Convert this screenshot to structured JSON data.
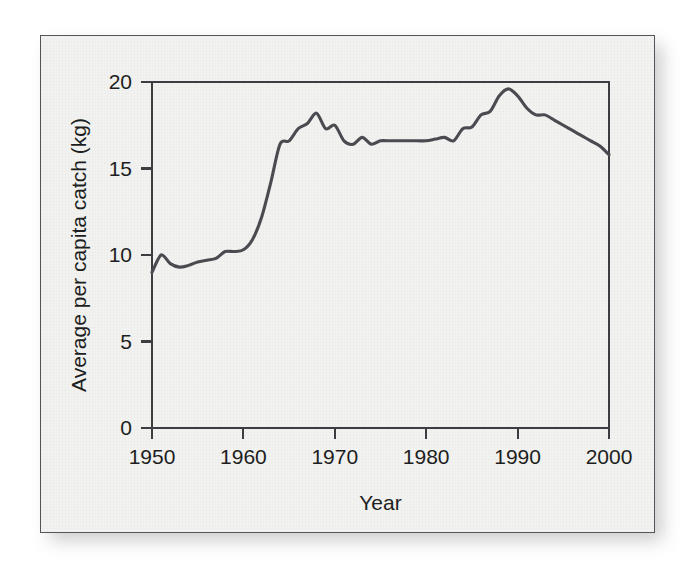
{
  "figure": {
    "background_color": "#f2f2f0",
    "frame_color": "#55565a",
    "line_color": "#4a4b50"
  },
  "chart_data": {
    "type": "line",
    "title": "",
    "xlabel": "Year",
    "ylabel": "Average per capita catch (kg)",
    "xlim": [
      1950,
      2000
    ],
    "ylim": [
      0,
      20
    ],
    "xticks": [
      1950,
      1960,
      1970,
      1980,
      1990,
      2000
    ],
    "xtick_labels": [
      "1950",
      "1960",
      "1970",
      "1980",
      "1990",
      "2000"
    ],
    "yticks": [
      0,
      5,
      10,
      15,
      20
    ],
    "ytick_labels": [
      "0",
      "5",
      "10",
      "15",
      "20"
    ],
    "grid": false,
    "legend": null,
    "series": [
      {
        "name": "Average per capita catch",
        "units": "kg",
        "x": [
          1950,
          1951,
          1952,
          1953,
          1954,
          1955,
          1956,
          1957,
          1958,
          1959,
          1960,
          1961,
          1962,
          1963,
          1964,
          1965,
          1966,
          1967,
          1968,
          1969,
          1970,
          1971,
          1972,
          1973,
          1974,
          1975,
          1976,
          1977,
          1978,
          1979,
          1980,
          1981,
          1982,
          1983,
          1984,
          1985,
          1986,
          1987,
          1988,
          1989,
          1990,
          1991,
          1992,
          1993,
          1994,
          1995,
          1996,
          1997,
          1998,
          1999,
          2000
        ],
        "values": [
          9.0,
          10.0,
          9.5,
          9.3,
          9.4,
          9.6,
          9.7,
          9.8,
          10.2,
          10.2,
          10.3,
          10.9,
          12.2,
          14.2,
          16.4,
          16.6,
          17.3,
          17.6,
          18.2,
          17.3,
          17.5,
          16.6,
          16.4,
          16.8,
          16.4,
          16.6,
          16.6,
          16.6,
          16.6,
          16.6,
          16.6,
          16.7,
          16.8,
          16.6,
          17.3,
          17.4,
          18.1,
          18.3,
          19.2,
          19.6,
          19.2,
          18.5,
          18.1,
          18.1,
          17.8,
          17.5,
          17.2,
          16.9,
          16.6,
          16.3,
          15.8
        ]
      }
    ]
  }
}
